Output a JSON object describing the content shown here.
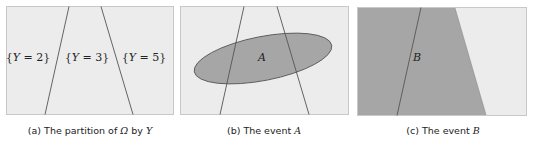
{
  "colors": {
    "light_fill": "#ececec",
    "shaded_fill": "#a6a6a6",
    "border": "#c8c8c8",
    "line": "#555555",
    "ellipse_stroke": "#5a5a5a"
  },
  "panels": [
    {
      "id": "a",
      "caption_prefix": "(a) The partition of ",
      "caption_omega": "Ω",
      "caption_mid": " by ",
      "caption_var": "Y",
      "regions": [
        {
          "label_open": "{",
          "label_var": "Y",
          "label_eq": " = 2",
          "label_close": "}"
        },
        {
          "label_open": "{",
          "label_var": "Y",
          "label_eq": " = 3",
          "label_close": "}"
        },
        {
          "label_open": "{",
          "label_var": "Y",
          "label_eq": " = 5",
          "label_close": "}"
        }
      ]
    },
    {
      "id": "b",
      "caption_prefix": "(b) The event ",
      "caption_var": "A",
      "event_label": "A"
    },
    {
      "id": "c",
      "caption_prefix": "(c) The event ",
      "caption_var": "B",
      "event_label": "B"
    }
  ]
}
